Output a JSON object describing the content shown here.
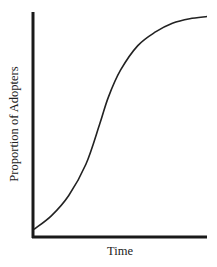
{
  "chart_data": {
    "type": "line",
    "title": "",
    "xlabel": "Time",
    "ylabel": "Proportion of Adopters",
    "grid": false,
    "legend": null,
    "xlim": [
      0,
      1
    ],
    "ylim": [
      0,
      1
    ],
    "series": [
      {
        "name": "S-curve (adoption)",
        "x": [
          0.0,
          0.1,
          0.2,
          0.3,
          0.38,
          0.43,
          0.5,
          0.6,
          0.7,
          0.8,
          0.9,
          1.0
        ],
        "values": [
          0.03,
          0.09,
          0.18,
          0.32,
          0.5,
          0.62,
          0.74,
          0.85,
          0.91,
          0.95,
          0.97,
          0.98
        ]
      }
    ],
    "colors": {
      "axis": "#1a1a1a",
      "curve": "#222222"
    }
  }
}
